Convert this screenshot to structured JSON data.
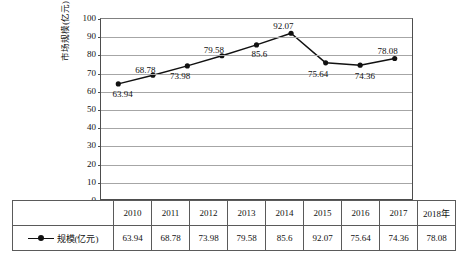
{
  "chart_data": {
    "type": "line",
    "title": "",
    "xlabel": "",
    "ylabel": "市场规模(亿元)",
    "categories": [
      "2010",
      "2011",
      "2012",
      "2013",
      "2014",
      "2015",
      "2016",
      "2017",
      "2018年"
    ],
    "values": [
      63.94,
      68.78,
      73.98,
      79.58,
      85.6,
      92.07,
      75.64,
      74.36,
      78.08
    ],
    "point_labels": [
      "63.94",
      "68.78",
      "73.98",
      "79.58",
      "85.6",
      "92.07",
      "75.64",
      "74.36",
      "78.08"
    ],
    "series": [
      {
        "name": "规模(亿元)",
        "values": [
          63.94,
          68.78,
          73.98,
          79.58,
          85.6,
          92.07,
          75.64,
          74.36,
          78.08
        ]
      }
    ],
    "ylim": [
      0,
      100
    ],
    "ytick_step": 10,
    "ytick_labels": [
      "100",
      "90",
      "80",
      "70",
      "60",
      "50",
      "40",
      "30",
      "20",
      "10",
      "0"
    ],
    "grid": true,
    "legend_position": "table-row-header",
    "marker": "filled-circle",
    "line_color": "#111111",
    "grid_color": "#a6a6a6",
    "axis_color": "#4d4d4d"
  },
  "table": {
    "corner": "",
    "series_label": "规模(亿元)",
    "headers": [
      "2010",
      "2011",
      "2012",
      "2013",
      "2014",
      "2015",
      "2016",
      "2017",
      "2018年"
    ],
    "row_values": [
      "63.94",
      "68.78",
      "73.98",
      "79.58",
      "85.6",
      "92.07",
      "75.64",
      "74.36",
      "78.08"
    ]
  }
}
